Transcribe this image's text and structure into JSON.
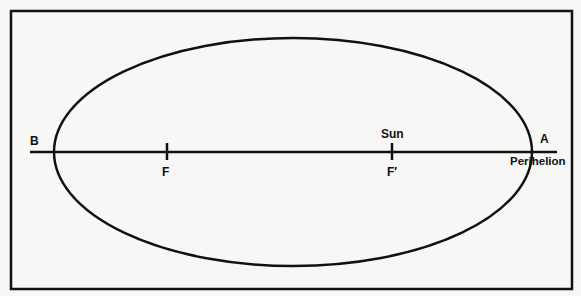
{
  "diagram": {
    "labels": {
      "point_a": "A",
      "point_b": "B",
      "focus_f": "F",
      "focus_f_prime": "F′",
      "sun": "Sun",
      "perihelion": "Perihelion"
    },
    "colors": {
      "stroke": "#111111",
      "background": "#f7f7f5"
    }
  }
}
